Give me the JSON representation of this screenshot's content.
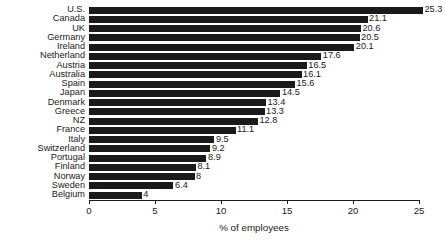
{
  "chart_data": {
    "type": "bar",
    "orientation": "horizontal",
    "title": "",
    "xlabel": "% of employees",
    "ylabel": "",
    "xlim": [
      0,
      25
    ],
    "xticks": [
      0,
      5,
      10,
      15,
      20,
      25
    ],
    "xtick_labels": [
      "0",
      "5",
      "10",
      "15",
      "20",
      "25"
    ],
    "grid": false,
    "legend": null,
    "bar_color": "#1a1a1a",
    "background_color": "#ffffff",
    "value_labels_shown": true,
    "categories": [
      "U.S.",
      "Canada",
      "UK",
      "Germany",
      "Ireland",
      "Netherland",
      "Austria",
      "Australia",
      "Spain",
      "Japan",
      "Denmark",
      "Greece",
      "NZ",
      "France",
      "Italy",
      "Switzerland",
      "Portugal",
      "Finland",
      "Norway",
      "Sweden",
      "Belgium"
    ],
    "values": [
      25.3,
      21.1,
      20.6,
      20.5,
      20.1,
      17.6,
      16.5,
      16.1,
      15.6,
      14.5,
      13.4,
      13.3,
      12.8,
      11.1,
      9.5,
      9.2,
      8.9,
      8.1,
      8,
      6.4,
      4
    ],
    "value_label_texts": [
      "25.3",
      "21.1",
      "20.6",
      "20.5",
      "20.1",
      "17.6",
      "16.5",
      "16.1",
      "15.6",
      "14.5",
      "13.4",
      "13.3",
      "12.8",
      "11.1",
      "9.5",
      "9.2",
      "8.9",
      "8.1",
      "8",
      "6.4",
      "4"
    ]
  }
}
